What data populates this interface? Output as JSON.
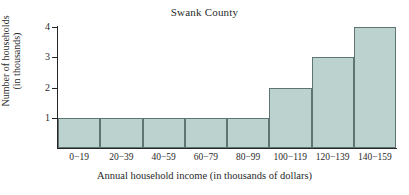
{
  "chart_data": {
    "type": "bar",
    "title": "Swank County",
    "xlabel": "Annual household income (in thousands of dollars)",
    "ylabel_line1": "Number of households",
    "ylabel_line2": "(in thousands)",
    "categories": [
      "0−19",
      "20−39",
      "40−59",
      "60−79",
      "80−99",
      "100−119",
      "120−139",
      "140−159"
    ],
    "values": [
      1,
      1,
      1,
      1,
      1,
      2,
      3,
      4
    ],
    "yticks": [
      "1",
      "2",
      "3",
      "4"
    ],
    "ytick_values": [
      1,
      2,
      3,
      4
    ],
    "ylim": [
      0,
      4
    ],
    "grid": false,
    "legend": false,
    "bar_fill_color": "#bcd2cf",
    "bar_edge_color": "#5f7573",
    "axis_color": "#262626",
    "background_color": "#ffffff"
  }
}
